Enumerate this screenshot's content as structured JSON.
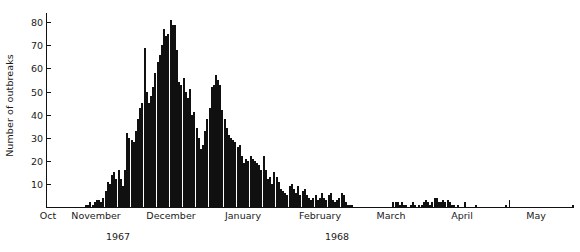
{
  "chart": {
    "type": "bar",
    "title": "",
    "xlabel": "",
    "ylabel": "Number of outbreaks",
    "axis_color": "#111111",
    "bar_fill": "#ffffff",
    "bar_edge": "#101010"
  },
  "yaxis": {
    "ticks": [
      10,
      20,
      30,
      40,
      50,
      60,
      70,
      80
    ],
    "tick_labels": [
      "10",
      "20",
      "30",
      "40",
      "50",
      "60",
      "70",
      "80"
    ],
    "min": 0,
    "max": 84,
    "grid": false
  },
  "xaxis": {
    "months": [
      {
        "label": "Oct",
        "center": 48
      },
      {
        "label": "November",
        "center": 96
      },
      {
        "label": "December",
        "center": 171
      },
      {
        "label": "January",
        "center": 243
      },
      {
        "label": "February",
        "center": 320
      },
      {
        "label": "March",
        "center": 391
      },
      {
        "label": "April",
        "center": 462
      },
      {
        "label": "May",
        "center": 536
      }
    ],
    "tick_positions": [
      341,
      437,
      509
    ],
    "years": [
      {
        "label": "1967",
        "center": 118
      },
      {
        "label": "1968",
        "center": 337
      }
    ]
  },
  "chart_data": {
    "type": "bar",
    "title": "",
    "xlabel": "",
    "ylabel": "Number of outbreaks",
    "ylim": [
      0,
      84
    ],
    "grid": false,
    "legend": null,
    "x_axis_type": "date-daily",
    "x_tick_labels": [
      "Oct",
      "November",
      "December",
      "January",
      "February",
      "March",
      "April",
      "May"
    ],
    "x_year_labels": [
      "1967",
      "1968"
    ],
    "categories": [
      "Oct 1",
      "Oct 2",
      "Oct 3",
      "Oct 4",
      "Oct 5",
      "Oct 6",
      "Oct 7",
      "Oct 8",
      "Oct 9",
      "Oct 10",
      "Oct 11",
      "Oct 12",
      "Oct 13",
      "Oct 14",
      "Oct 15",
      "Oct 16",
      "Oct 17",
      "Oct 18",
      "Oct 19",
      "Oct 20",
      "Oct 21",
      "Oct 22",
      "Oct 23",
      "Oct 24",
      "Oct 25",
      "Oct 26",
      "Oct 27",
      "Oct 28",
      "Oct 29",
      "Oct 30",
      "Oct 31",
      "Nov 1",
      "Nov 2",
      "Nov 3",
      "Nov 4",
      "Nov 5",
      "Nov 6",
      "Nov 7",
      "Nov 8",
      "Nov 9",
      "Nov 10",
      "Nov 11",
      "Nov 12",
      "Nov 13",
      "Nov 14",
      "Nov 15",
      "Nov 16",
      "Nov 17",
      "Nov 18",
      "Nov 19",
      "Nov 20",
      "Nov 21",
      "Nov 22",
      "Nov 23",
      "Nov 24",
      "Nov 25",
      "Nov 26",
      "Nov 27",
      "Nov 28",
      "Nov 29",
      "Nov 30",
      "Dec 1",
      "Dec 2",
      "Dec 3",
      "Dec 4",
      "Dec 5",
      "Dec 6",
      "Dec 7",
      "Dec 8",
      "Dec 9",
      "Dec 10",
      "Dec 11",
      "Dec 12",
      "Dec 13",
      "Dec 14",
      "Dec 15",
      "Dec 16",
      "Dec 17",
      "Dec 18",
      "Dec 19",
      "Dec 20",
      "Dec 21",
      "Dec 22",
      "Dec 23",
      "Dec 24",
      "Dec 25",
      "Dec 26",
      "Dec 27",
      "Dec 28",
      "Dec 29",
      "Dec 30",
      "Dec 31",
      "Jan 1",
      "Jan 2",
      "Jan 3",
      "Jan 4",
      "Jan 5",
      "Jan 6",
      "Jan 7",
      "Jan 8",
      "Jan 9",
      "Jan 10",
      "Jan 11",
      "Jan 12",
      "Jan 13",
      "Jan 14",
      "Jan 15",
      "Jan 16",
      "Jan 17",
      "Jan 18",
      "Jan 19",
      "Jan 20",
      "Jan 21",
      "Jan 22",
      "Jan 23",
      "Jan 24",
      "Jan 25",
      "Jan 26",
      "Jan 27",
      "Jan 28",
      "Jan 29",
      "Jan 30",
      "Jan 31",
      "Feb 1",
      "Feb 2",
      "Feb 3",
      "Feb 4",
      "Feb 5",
      "Feb 6",
      "Feb 7",
      "Feb 8",
      "Feb 9",
      "Feb 10",
      "Feb 11",
      "Feb 12",
      "Feb 13",
      "Feb 14",
      "Feb 15",
      "Feb 16",
      "Feb 17",
      "Feb 18",
      "Feb 19",
      "Feb 20",
      "Feb 21",
      "Feb 22",
      "Feb 23",
      "Feb 24",
      "Feb 25",
      "Feb 26",
      "Feb 27",
      "Feb 28",
      "Feb 29",
      "Mar 1",
      "Mar 2",
      "Mar 3",
      "Mar 4",
      "Mar 5",
      "Mar 6",
      "Mar 7",
      "Mar 8",
      "Mar 9",
      "Mar 10",
      "Mar 11",
      "Mar 12",
      "Mar 13",
      "Mar 14",
      "Mar 15",
      "Mar 16",
      "Mar 17",
      "Mar 18",
      "Mar 19",
      "Mar 20",
      "Mar 21",
      "Mar 22",
      "Mar 23",
      "Mar 24",
      "Mar 25",
      "Mar 26",
      "Mar 27",
      "Mar 28",
      "Mar 29",
      "Mar 30",
      "Mar 31",
      "Apr 1",
      "Apr 2",
      "Apr 3",
      "Apr 4",
      "Apr 5",
      "Apr 6",
      "Apr 7",
      "Apr 8",
      "Apr 9",
      "Apr 10",
      "Apr 11",
      "Apr 12",
      "Apr 13",
      "Apr 14",
      "Apr 15",
      "Apr 16",
      "Apr 17",
      "Apr 18",
      "Apr 19",
      "Apr 20",
      "Apr 21",
      "Apr 22",
      "Apr 23",
      "Apr 24",
      "Apr 25",
      "Apr 26",
      "Apr 27",
      "Apr 28",
      "Apr 29",
      "Apr 30",
      "May 1",
      "May 2",
      "May 3",
      "May 4",
      "May 5",
      "May 6",
      "May 7",
      "May 8",
      "May 9",
      "May 10",
      "May 11",
      "May 12",
      "May 13",
      "May 14",
      "May 15",
      "May 16",
      "May 17",
      "May 18",
      "May 19",
      "May 20",
      "May 21",
      "May 22",
      "May 23",
      "May 24",
      "May 25",
      "May 26",
      "May 27",
      "May 28",
      "May 29",
      "May 30",
      "May 31"
    ],
    "values": [
      0,
      0,
      0,
      0,
      0,
      0,
      0,
      0,
      0,
      0,
      0,
      0,
      0,
      0,
      0,
      0,
      0,
      0,
      1,
      1,
      2,
      1,
      2,
      3,
      3,
      2,
      4,
      7,
      11,
      10,
      14,
      15,
      12,
      16,
      12,
      9,
      16,
      32,
      30,
      29,
      28,
      33,
      38,
      43,
      45,
      69,
      50,
      45,
      48,
      52,
      58,
      63,
      66,
      70,
      77,
      74,
      75,
      81,
      79,
      79,
      68,
      54,
      53,
      56,
      50,
      47,
      51,
      40,
      41,
      34,
      30,
      25,
      27,
      33,
      38,
      43,
      52,
      53,
      57,
      55,
      53,
      42,
      38,
      34,
      31,
      30,
      29,
      28,
      26,
      27,
      22,
      19,
      21,
      20,
      22,
      21,
      20,
      19,
      18,
      16,
      22,
      16,
      12,
      13,
      10,
      15,
      13,
      11,
      8,
      7,
      6,
      5,
      9,
      10,
      8,
      6,
      9,
      5,
      7,
      8,
      5,
      4,
      3,
      4,
      5,
      3,
      4,
      6,
      4,
      3,
      5,
      6,
      3,
      2,
      3,
      4,
      6,
      5,
      2,
      1,
      1,
      1,
      0,
      0,
      0,
      0,
      0,
      0,
      0,
      0,
      0,
      0,
      0,
      0,
      0,
      0,
      0,
      0,
      0,
      0,
      2,
      2,
      2,
      1,
      2,
      1,
      1,
      0,
      1,
      2,
      1,
      0,
      1,
      1,
      2,
      3,
      2,
      1,
      2,
      4,
      4,
      2,
      2,
      3,
      2,
      3,
      2,
      1,
      1,
      0,
      1,
      0,
      0,
      2,
      0,
      0,
      0,
      0,
      1,
      0,
      0,
      0,
      0,
      0,
      0,
      0,
      0,
      0,
      0,
      0,
      0,
      0,
      1,
      0,
      0,
      0,
      0,
      0,
      0,
      0,
      0,
      0,
      0,
      0,
      0,
      0,
      0,
      0,
      0,
      0,
      0,
      0,
      0,
      0,
      0,
      0,
      0,
      0,
      0,
      0,
      0,
      0,
      0,
      1
    ]
  }
}
